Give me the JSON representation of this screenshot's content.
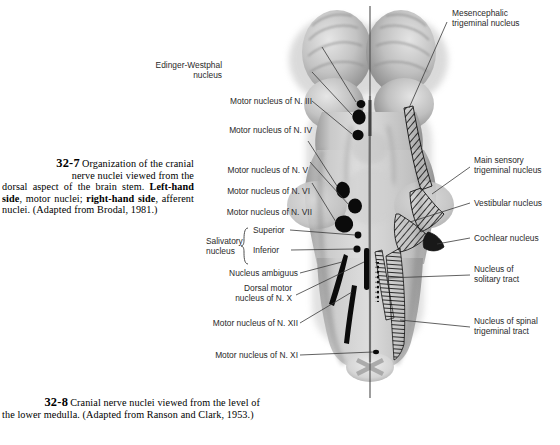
{
  "figure": {
    "plate_number": "32-7",
    "caption_lines": [
      "Organization of the cranial",
      "nerve nuclei viewed from the",
      "dorsal aspect of the brain stem. ",
      "Left-hand side",
      ", motor nuclei; ",
      "right-hand side",
      ", afferent nuclei. (Adapted from Brodal, 1981.)"
    ],
    "caption_plain": "Organization of the cranial nerve nuclei viewed from the dorsal aspect of the brain stem. Left-hand side, motor nuclei; right-hand side, afferent nuclei. (Adapted from Brodal, 1981.)",
    "caption_seg": {
      "a": "Organization of the cranial",
      "b": "nerve nuclei viewed from the",
      "c": "dorsal aspect of the brain stem. ",
      "d_bold": "Left-",
      "e_bold": "hand side",
      "f": ", motor nuclei; ",
      "g_bold": "right-hand",
      "h_bold": "side",
      "i": ", afferent nuclei. (Adapted from",
      "j": "Brodal, 1981.)"
    }
  },
  "next_figure": {
    "plate_number": "32-8",
    "caption_seg": {
      "a": "Cranial nerve nuclei viewed from the level of",
      "b": "the lower medulla. (Adapted from Ranson and",
      "c": "Clark, 1953.)"
    },
    "caption_plain": "Cranial nerve nuclei viewed from the level of the lower medulla. (Adapted from Ranson and Clark, 1953.)"
  },
  "labels_left": [
    {
      "id": "edinger-westphal",
      "line1": "Edinger-Westphal",
      "line2": "nucleus"
    },
    {
      "id": "motor-nucleus-iii",
      "line1": "Motor nucleus of N. III"
    },
    {
      "id": "motor-nucleus-iv",
      "line1": "Motor nucleus of N. IV"
    },
    {
      "id": "motor-nucleus-v",
      "line1": "Motor nucleus of N. V"
    },
    {
      "id": "motor-nucleus-vi",
      "line1": "Motor nucleus of N. VI"
    },
    {
      "id": "motor-nucleus-vii",
      "line1": "Motor nucleus of N. VII"
    },
    {
      "id": "salivatory-nucleus",
      "line1": "Salivatory",
      "line2": "nucleus"
    },
    {
      "id": "salivatory-superior",
      "line1": "Superior"
    },
    {
      "id": "salivatory-inferior",
      "line1": "Inferior"
    },
    {
      "id": "nucleus-ambiguus",
      "line1": "Nucleus ambiguus"
    },
    {
      "id": "dorsal-motor-x",
      "line1": "Dorsal motor",
      "line2": "nucleus of N. X"
    },
    {
      "id": "motor-nucleus-xii",
      "line1": "Motor nucleus of N. XII"
    },
    {
      "id": "motor-nucleus-xi",
      "line1": "Motor nucleus of N. XI"
    }
  ],
  "labels_right": [
    {
      "id": "mesencephalic-trigeminal",
      "line1": "Mesencephalic",
      "line2": "trigeminal nucleus"
    },
    {
      "id": "main-sensory-trigeminal",
      "line1": "Main sensory",
      "line2": "trigeminal nucleus"
    },
    {
      "id": "vestibular-nucleus",
      "line1": "Vestibular nucleus"
    },
    {
      "id": "cochlear-nucleus",
      "line1": "Cochlear nucleus"
    },
    {
      "id": "nucleus-solitary-tract",
      "line1": "Nucleus of",
      "line2": "solitary tract"
    },
    {
      "id": "nucleus-spinal-trigeminal",
      "line1": "Nucleus of spinal",
      "line2": "trigeminal tract"
    }
  ],
  "colors": {
    "background": "#ffffff",
    "text": "#000000",
    "label_text": "#2a2a2a",
    "leader_line": "#3a3a3a",
    "nucleus_fill": "#0b0b0b",
    "brainstem_light": "#d8d8d8",
    "brainstem_mid": "#b4b4b4",
    "brainstem_dark": "#8d8d8d",
    "brainstem_shadow": "#6f6f6f",
    "midline": "#555555"
  },
  "art": {
    "description": "Dorsal view of human brain stem, midbrain colliculi at top, pons with cerebellar peduncles, medulla tapering to pyramidal decussation at bottom; vertical midline axis line through center.",
    "midline_label": "midline-axis"
  }
}
